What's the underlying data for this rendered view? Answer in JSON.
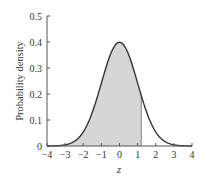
{
  "chart_data": {
    "type": "area",
    "title": "",
    "xlabel": "z",
    "ylabel": "Probability density",
    "xlim": [
      -4,
      4
    ],
    "ylim": [
      0,
      0.5
    ],
    "xticks": [
      -4,
      -3,
      -2,
      -1,
      0,
      1,
      2,
      3,
      4
    ],
    "xtick_labels": [
      "−4",
      "−3",
      "−2",
      "−1",
      "0",
      "1",
      "2",
      "3",
      "4"
    ],
    "yticks": [
      0,
      0.1,
      0.2,
      0.3,
      0.4,
      0.5
    ],
    "ytick_labels": [
      "0",
      "0.1",
      "0.2",
      "0.3",
      "0.4",
      "0.5"
    ],
    "grid": false,
    "legend": null,
    "series": [
      {
        "name": "Standard normal density",
        "function": "exp(-z^2/2)/sqrt(2*pi)",
        "x": [
          -4,
          -3,
          -2,
          -1,
          0,
          1,
          2,
          3,
          4
        ],
        "values": [
          0.0001,
          0.0044,
          0.054,
          0.242,
          0.399,
          0.242,
          0.054,
          0.0044,
          0.0001
        ]
      }
    ],
    "shaded_region": {
      "from": -4,
      "to": 1.2,
      "color": "#d6d6d6"
    },
    "colors": {
      "curve": "#333333",
      "fill": "#d6d6d6",
      "axis": "#555555"
    }
  }
}
